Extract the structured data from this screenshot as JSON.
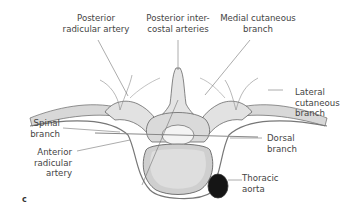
{
  "figure": {
    "panel_letter": "c",
    "labels": {
      "posterior_radicular_artery": [
        "Posterior",
        "radicular artery"
      ],
      "posterior_intercostal_arteries": [
        "Posterior inter-",
        "costal arteries"
      ],
      "medial_cutaneous_branch": [
        "Medial cutaneous",
        "branch"
      ],
      "lateral_cutaneous_branch": [
        "Lateral",
        "cutaneous",
        "branch"
      ],
      "spinal_branch": [
        "Spinal",
        "branch"
      ],
      "anterior_radicular_artery": [
        "Anterior",
        "radicular",
        "artery"
      ],
      "dorsal_branch": [
        "Dorsal",
        "branch"
      ],
      "thoracic_aorta": [
        "Thoracic",
        "aorta"
      ]
    },
    "colors": {
      "bone_light": "#e6e6e6",
      "bone_shade": "#b9b9b9",
      "outline": "#555555",
      "aorta": "#151515",
      "leader_line": "#666666"
    }
  }
}
